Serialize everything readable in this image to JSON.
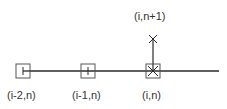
{
  "diagram": {
    "type": "stencil",
    "colors": {
      "line": "#2a2a2a",
      "box": "#555555",
      "text": "#333333",
      "background": "#ffffff"
    },
    "nodes": [
      {
        "id": "n0",
        "label": "(i-2,n)",
        "marker": "box-with-left-tick"
      },
      {
        "id": "n1",
        "label": "(i-1,n)",
        "marker": "box-with-vertical-tick"
      },
      {
        "id": "n2",
        "label": "(i,n)",
        "marker": "box-with-cross"
      },
      {
        "id": "n3",
        "label": "(i,n+1)",
        "marker": "cross"
      }
    ],
    "edges": [
      {
        "from": "n0",
        "to": "n2",
        "direction": "horizontal",
        "extends_right": true
      },
      {
        "from": "n2",
        "to": "n3",
        "direction": "vertical"
      }
    ]
  }
}
